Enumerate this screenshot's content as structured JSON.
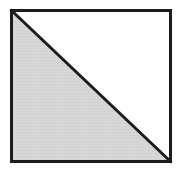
{
  "figure": {
    "title": "Square divided by a diagonal with lower-left half shaded",
    "canvas": {
      "width": 183,
      "height": 173,
      "background_color": "#ffffff"
    },
    "square": {
      "name": "outer-square",
      "left": 10,
      "top": 9,
      "right": 172,
      "bottom": 163,
      "width": 162,
      "height": 154,
      "stroke_color": "#1c1c1c",
      "stroke_width": 3,
      "fill_color": "#ffffff"
    },
    "diagonal": {
      "name": "diagonal-line",
      "from_corner": "top-left",
      "to_corner": "bottom-right",
      "x1": 10,
      "y1": 9,
      "x2": 172,
      "y2": 163,
      "stroke_color": "#1c1c1c",
      "stroke_width": 3
    },
    "regions": [
      {
        "name": "lower-left-triangle",
        "position": "lower-left",
        "shaded": true,
        "fill_color": "#d8d8d8",
        "vertices": "10,9 10,163 172,163",
        "label": "shaded half"
      },
      {
        "name": "upper-right-triangle",
        "position": "upper-right",
        "shaded": false,
        "fill_color": "#ffffff",
        "vertices": "10,9 172,9 172,163",
        "label": "unshaded half"
      }
    ],
    "texture": {
      "name": "scan-texture",
      "description": "faint horizontal scan striping over shaded region",
      "color": "#cfcfcf"
    }
  }
}
